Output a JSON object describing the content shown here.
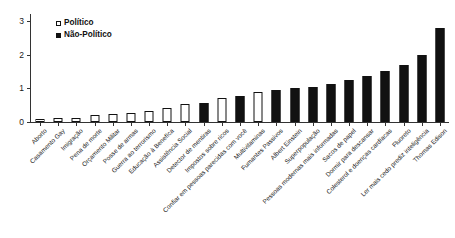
{
  "chart_data": {
    "type": "bar",
    "title": "",
    "subtitle": "",
    "xlabel": "",
    "ylabel": "",
    "ylim": [
      0,
      3.2
    ],
    "yticks": [
      0,
      1,
      2,
      3
    ],
    "ytick_labels": [
      "0",
      "1",
      "2",
      "3"
    ],
    "grid": false,
    "legend_position": "top-left",
    "legend": [
      {
        "name": "Político",
        "fill": "#ffffff",
        "edge": "#111111"
      },
      {
        "name": "Não-Político",
        "fill": "#111111",
        "edge": "#111111"
      }
    ],
    "categories": [
      "Aborto",
      "Casamento Gay",
      "Imigração",
      "Pena de morte",
      "Orçamento Militar",
      "Posse de armas",
      "Guerra ao terrorismo",
      "Educação à Benefíca",
      "Assistência Social",
      "Detector de mentiras",
      "Impostos sobre ricos",
      "Confiar em pessoas parecidas com você",
      "Multivitaminas",
      "Fumantes Passivos",
      "Albert Einstein",
      "Superpopulação",
      "Pessoas modernas mais informadas",
      "Sacos de papel",
      "Dormir para descansar",
      "Colesterol e doenças cardíacas",
      "Fluoreto",
      "Ler mais cedo prediz inteligência",
      "Thomas Edison"
    ],
    "group_of": [
      "Político",
      "Político",
      "Político",
      "Político",
      "Político",
      "Político",
      "Político",
      "Político",
      "Político",
      "Não-Político",
      "Político",
      "Não-Político",
      "Político",
      "Não-Político",
      "Não-Político",
      "Não-Político",
      "Não-Político",
      "Não-Político",
      "Não-Político",
      "Não-Político",
      "Não-Político",
      "Não-Político",
      "Não-Político"
    ],
    "values": [
      0.1,
      0.12,
      0.13,
      0.2,
      0.24,
      0.28,
      0.32,
      0.42,
      0.52,
      0.55,
      0.72,
      0.78,
      0.88,
      0.95,
      1.0,
      1.05,
      1.12,
      1.25,
      1.35,
      1.5,
      1.7,
      2.0,
      2.8
    ]
  }
}
